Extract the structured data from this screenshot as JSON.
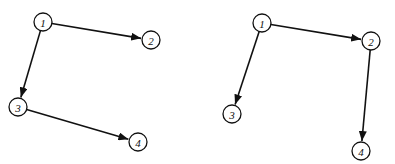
{
  "colors": {
    "stroke": "#111111",
    "background": "#ffffff",
    "node_fill": "#ffffff"
  },
  "graphs": [
    {
      "name": "left-graph",
      "nodes": [
        {
          "id": "1",
          "label": "1",
          "x": 43,
          "y": 22
        },
        {
          "id": "2",
          "label": "2",
          "x": 151,
          "y": 40
        },
        {
          "id": "3",
          "label": "3",
          "x": 18,
          "y": 107
        },
        {
          "id": "4",
          "label": "4",
          "x": 138,
          "y": 142
        }
      ],
      "edges": [
        {
          "from": "1",
          "to": "2"
        },
        {
          "from": "1",
          "to": "3"
        },
        {
          "from": "3",
          "to": "4"
        }
      ]
    },
    {
      "name": "right-graph",
      "nodes": [
        {
          "id": "1",
          "label": "1",
          "x": 262,
          "y": 23
        },
        {
          "id": "2",
          "label": "2",
          "x": 371,
          "y": 41
        },
        {
          "id": "3",
          "label": "3",
          "x": 232,
          "y": 114
        },
        {
          "id": "4",
          "label": "4",
          "x": 361,
          "y": 151
        }
      ],
      "edges": [
        {
          "from": "1",
          "to": "2"
        },
        {
          "from": "1",
          "to": "3"
        },
        {
          "from": "2",
          "to": "4"
        }
      ]
    }
  ],
  "node_radius": 9
}
